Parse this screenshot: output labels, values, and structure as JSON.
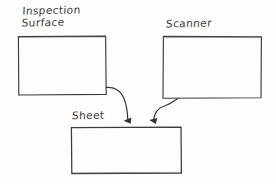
{
  "diagram": {
    "style": "hand-drawn sketch",
    "stroke_color": "#3a3a38",
    "background_color": "#fdfdfc",
    "nodes": [
      {
        "id": "inspection-surface",
        "label": "Inspection\nSurface",
        "shape": "rectangle",
        "x": 18,
        "y": 36,
        "width": 88,
        "height": 59
      },
      {
        "id": "scanner",
        "label": "Scanner",
        "shape": "rectangle",
        "x": 163,
        "y": 36,
        "width": 98,
        "height": 62
      },
      {
        "id": "sheet",
        "label": "Sheet",
        "shape": "rectangle",
        "x": 71,
        "y": 127,
        "width": 110,
        "height": 46
      }
    ],
    "edges": [
      {
        "id": "inspection-surface-to-sheet",
        "from": "inspection-surface",
        "to": "sheet",
        "arrowhead": "filled-triangle",
        "label": ""
      },
      {
        "id": "scanner-to-sheet",
        "from": "scanner",
        "to": "sheet",
        "arrowhead": "filled-triangle",
        "label": ""
      }
    ]
  }
}
